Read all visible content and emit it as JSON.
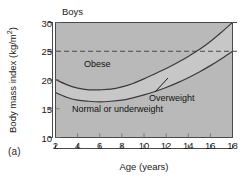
{
  "figure": {
    "panel_label": "(a)",
    "title": "Boys",
    "xlabel": "Age (years)",
    "ylabel_text": "Body mass index (kg/m",
    "ylabel_sup": "2",
    "ylabel_tail": ")"
  },
  "chart_data": {
    "type": "line",
    "title": "Boys",
    "xlabel": "Age (years)",
    "ylabel": "Body mass index (kg/m2)",
    "xlim": [
      2,
      18
    ],
    "ylim": [
      10,
      30
    ],
    "xticks": [
      2,
      4,
      6,
      8,
      10,
      12,
      14,
      16,
      18
    ],
    "yticks": [
      10,
      15,
      20,
      25,
      30
    ],
    "grid": false,
    "legend": "none",
    "x": [
      2,
      3,
      4,
      5,
      6,
      7,
      8,
      9,
      10,
      11,
      12,
      13,
      14,
      15,
      16,
      17,
      18
    ],
    "series": [
      {
        "name": "Obesity cut-off",
        "values": [
          20.1,
          19.2,
          18.6,
          18.3,
          18.3,
          18.4,
          18.8,
          19.4,
          20.2,
          21.1,
          22.0,
          23.0,
          24.1,
          25.3,
          26.7,
          28.3,
          30.0
        ]
      },
      {
        "name": "Overweight cut-off",
        "values": [
          17.8,
          17.0,
          16.5,
          16.3,
          16.2,
          16.3,
          16.5,
          16.9,
          17.4,
          18.0,
          18.7,
          19.5,
          20.4,
          21.4,
          22.5,
          23.7,
          25.0
        ]
      }
    ],
    "reference_lines": [
      {
        "name": "adult-obesity-30",
        "y": 30,
        "style": "dashed"
      },
      {
        "name": "adult-overweight-25",
        "y": 25,
        "style": "dashed"
      }
    ],
    "annotations": [
      {
        "name": "obese",
        "text": "Obese",
        "x": 4.9,
        "y": 23.0
      },
      {
        "name": "normal-or-underweight",
        "text": "Normal or underweight",
        "x": 3.6,
        "y": 14.6
      },
      {
        "name": "overweight",
        "text": "Overweight",
        "x": 11.2,
        "y": 17.6,
        "leader": true
      }
    ],
    "band_labels": {
      "obese": "Obese",
      "normal": "Normal or underweight",
      "overweight": "Overweight"
    },
    "colors": {
      "background": "#b9b9b9",
      "band_between": "#c6c6c6",
      "curve": "#3a3a3a",
      "axis": "#4a4a4a",
      "text": "#111111"
    }
  }
}
